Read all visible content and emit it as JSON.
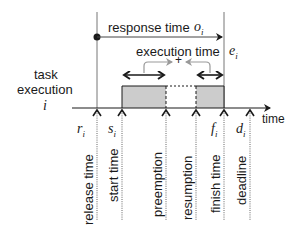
{
  "diagram": {
    "title_left": [
      "task",
      "execution"
    ],
    "task_symbol": "i",
    "response_time": {
      "label": "response time",
      "symbol": "o",
      "subscript": "i"
    },
    "execution_time": {
      "label": "execution time",
      "symbol": "e",
      "subscript": "i",
      "combine_symbol": "+"
    },
    "time_axis_label": "time",
    "events": [
      {
        "id": "release",
        "label": "release time",
        "symbol": "r",
        "subscript": "i",
        "x": 97
      },
      {
        "id": "start",
        "label": "start time",
        "symbol": "s",
        "subscript": "i",
        "x": 122
      },
      {
        "id": "preemption",
        "label": "preemption",
        "symbol": "",
        "subscript": "",
        "x": 166
      },
      {
        "id": "resumption",
        "label": "resumption",
        "symbol": "",
        "subscript": "",
        "x": 196
      },
      {
        "id": "finish",
        "label": "finish time",
        "symbol": "f",
        "subscript": "i",
        "x": 224
      },
      {
        "id": "deadline",
        "label": "deadline",
        "symbol": "d",
        "subscript": "i",
        "x": 250
      }
    ],
    "colors": {
      "execution_fill": "#cccccc",
      "line": "#1a1a1a",
      "guide": "#777777",
      "bracket": "#999999"
    }
  }
}
